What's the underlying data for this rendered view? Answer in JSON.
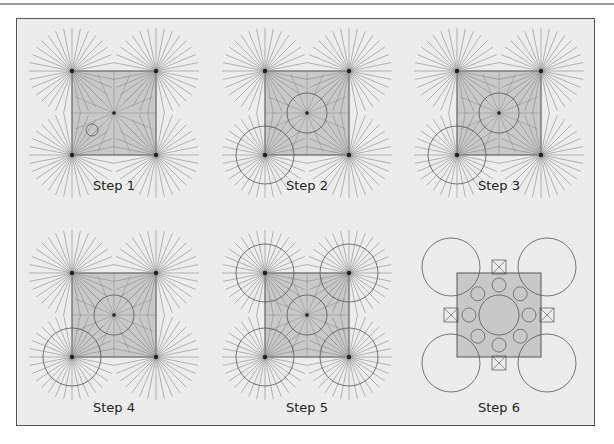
{
  "figure": {
    "title": "",
    "panels": [
      {
        "id": 1,
        "label": "Step 1",
        "cx": 114,
        "cy": 113,
        "mode": "rays",
        "big_circles": [],
        "center_circle": false,
        "small_poly": true
      },
      {
        "id": 2,
        "label": "Step 2",
        "cx": 307,
        "cy": 113,
        "mode": "rays",
        "big_circles": [
          2
        ],
        "center_circle": true,
        "small_poly": false
      },
      {
        "id": 3,
        "label": "Step 3",
        "cx": 499,
        "cy": 113,
        "mode": "rays",
        "big_circles": [
          2
        ],
        "center_circle": true,
        "small_poly": false
      },
      {
        "id": 4,
        "label": "Step 4",
        "cx": 114,
        "cy": 315,
        "mode": "rays",
        "big_circles": [
          2
        ],
        "center_circle": true,
        "small_poly": false
      },
      {
        "id": 5,
        "label": "Step 5",
        "cx": 307,
        "cy": 315,
        "mode": "rays",
        "big_circles": [
          0,
          1,
          2,
          3
        ],
        "center_circle": true,
        "small_poly": false
      },
      {
        "id": 6,
        "label": "Step 6",
        "cx": 499,
        "cy": 315,
        "mode": "final",
        "big_circles": [
          0,
          1,
          2,
          3
        ],
        "center_circle": true,
        "small_poly": false
      }
    ],
    "colors": {
      "background": "#ececec",
      "square_fill": "#c8c8c8",
      "ray": "#8a8a8a",
      "line": "#555555",
      "frame": "#555555"
    }
  }
}
